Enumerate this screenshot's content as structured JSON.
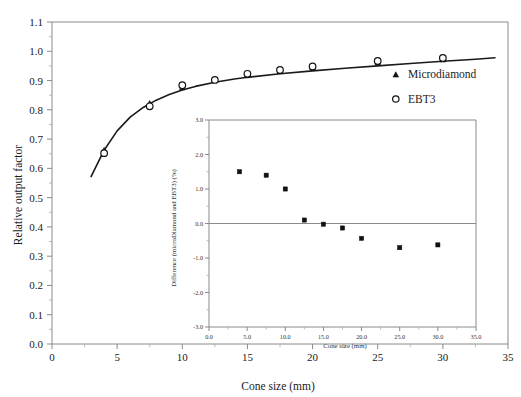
{
  "chart_data": [
    {
      "id": "main",
      "type": "scatter",
      "title": "",
      "xlabel": "Cone size (mm)",
      "ylabel": "Relative output factor",
      "xlim": [
        0,
        35
      ],
      "ylim": [
        0.0,
        1.1
      ],
      "xticks": [
        "0",
        "5",
        "10",
        "15",
        "20",
        "25",
        "30",
        "35"
      ],
      "xtick_values": [
        0,
        5,
        10,
        15,
        20,
        25,
        30,
        35
      ],
      "yticks": [
        "0.0",
        "0.1",
        "0.2",
        "0.3",
        "0.4",
        "0.5",
        "0.6",
        "0.7",
        "0.8",
        "0.9",
        "1.0",
        "1.1"
      ],
      "ytick_values": [
        0.0,
        0.1,
        0.2,
        0.3,
        0.4,
        0.5,
        0.6,
        0.7,
        0.8,
        0.9,
        1.0,
        1.1
      ],
      "grid": false,
      "legend_position": "right-inside",
      "legend": [
        "Microdiamond",
        "EBT3"
      ],
      "x": [
        4.0,
        7.5,
        10.0,
        12.5,
        15.0,
        17.5,
        20.0,
        25.0,
        30.0
      ],
      "series": [
        {
          "name": "Microdiamond",
          "marker": "filled-triangle",
          "values": [
            0.663,
            0.823,
            0.877,
            0.903,
            0.92,
            0.932,
            0.945,
            0.962,
            0.972
          ]
        },
        {
          "name": "EBT3",
          "marker": "open-circle",
          "values": [
            0.652,
            0.812,
            0.884,
            0.902,
            0.923,
            0.936,
            0.948,
            0.967,
            0.977
          ]
        }
      ],
      "fit_curve": {
        "name": "fitted curve",
        "x": [
          3.0,
          4.0,
          5.0,
          6.0,
          7.0,
          8.0,
          9.0,
          10.0,
          11.0,
          12.5,
          14.0,
          15.0,
          17.5,
          20.0,
          22.5,
          25.0,
          27.5,
          30.0,
          32.5,
          34.0
        ],
        "y": [
          0.572,
          0.662,
          0.728,
          0.775,
          0.808,
          0.833,
          0.852,
          0.868,
          0.88,
          0.894,
          0.905,
          0.911,
          0.923,
          0.933,
          0.942,
          0.95,
          0.958,
          0.966,
          0.973,
          0.978
        ]
      }
    },
    {
      "id": "inset",
      "type": "scatter",
      "title": "",
      "xlabel": "Cone size (mm)",
      "ylabel": "Difference (microDiamond and EBT3) (%)",
      "xlim": [
        0.0,
        35.0
      ],
      "ylim": [
        -3.0,
        3.0
      ],
      "xticks": [
        "0.0",
        "5.0",
        "10.0",
        "15.0",
        "20.0",
        "25.0",
        "30.0",
        "35.0"
      ],
      "xtick_values": [
        0.0,
        5.0,
        10.0,
        15.0,
        20.0,
        25.0,
        30.0,
        35.0
      ],
      "yticks": [
        "3.0",
        "2.0",
        "1.0",
        "0.0",
        "-1.0",
        "-2.0",
        "-3.0"
      ],
      "ytick_values": [
        3.0,
        2.0,
        1.0,
        0.0,
        -1.0,
        -2.0,
        -3.0
      ],
      "grid": false,
      "legend_position": "none",
      "zero_reference_line": 0.0,
      "categories": [
        4.0,
        7.5,
        10.0,
        12.5,
        15.0,
        17.5,
        20.0,
        25.0,
        30.0
      ],
      "x": [
        4.0,
        7.5,
        10.0,
        12.5,
        15.0,
        17.5,
        20.0,
        25.0,
        30.0
      ],
      "values": [
        1.5,
        1.4,
        1.0,
        0.1,
        -0.02,
        -0.13,
        -0.43,
        -0.7,
        -0.62
      ],
      "series": [
        {
          "name": "Difference",
          "marker": "filled-square",
          "values": [
            1.5,
            1.4,
            1.0,
            0.1,
            -0.02,
            -0.13,
            -0.43,
            -0.7,
            -0.62
          ]
        }
      ]
    }
  ],
  "figure": {
    "main": {
      "xlabel": "Cone size (mm)",
      "ylabel": "Relative output factor",
      "legend": [
        {
          "label": "Microdiamond",
          "marker": "filled-triangle"
        },
        {
          "label": "EBT3",
          "marker": "open-circle"
        }
      ]
    },
    "inset": {
      "xlabel": "Cone size (mm)",
      "ylabel": "Difference (microDiamond and EBT3) (%)"
    },
    "colors": {
      "marker": "#111111",
      "curve": "#1a1a1a",
      "axis": "#8a8a8a",
      "background": "#ffffff"
    }
  }
}
